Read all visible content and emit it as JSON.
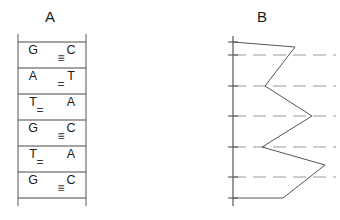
{
  "figure": {
    "panels": [
      {
        "id": "A",
        "label": "A",
        "label_x": 50,
        "label_y": 22
      },
      {
        "id": "B",
        "label": "B",
        "label_x": 262,
        "label_y": 22
      }
    ]
  },
  "panel_a": {
    "name": "dna-base-pair-ladder",
    "rail_left_x": 18,
    "rail_right_x": 86,
    "rung_top_y": 42,
    "rung_spacing": 26,
    "rung_count": 7,
    "rows": [
      {
        "left_base": "G",
        "right_base": "C",
        "bond": "≡",
        "bond_type": "triple",
        "bond_align": "right"
      },
      {
        "left_base": "A",
        "right_base": "T",
        "bond": "=",
        "bond_type": "double",
        "bond_align": "right"
      },
      {
        "left_base": "T",
        "right_base": "A",
        "bond": "=",
        "bond_type": "double",
        "bond_align": "left"
      },
      {
        "left_base": "G",
        "right_base": "C",
        "bond": "≡",
        "bond_type": "triple",
        "bond_align": "right"
      },
      {
        "left_base": "T",
        "right_base": "A",
        "bond": "=",
        "bond_type": "double",
        "bond_align": "left"
      },
      {
        "left_base": "G",
        "right_base": "C",
        "bond": "≡",
        "bond_type": "triple",
        "bond_align": "right"
      }
    ]
  },
  "chart_data": {
    "type": "line",
    "title": "B",
    "xlabel": "",
    "ylabel": "",
    "orientation": "vertical-axis-left",
    "grid": true,
    "grid_style": "dashed-horizontal",
    "legend": "none",
    "axis_x": 233,
    "axis_top_y": 42,
    "axis_bottom_y": 198,
    "gridline_y": [
      55,
      86,
      116,
      147,
      177
    ],
    "tick_y": [
      42,
      55,
      86,
      116,
      147,
      177,
      198
    ],
    "baseline_x": 233,
    "x": [
      295,
      265,
      312,
      262,
      325,
      283
    ],
    "y": [
      47,
      86,
      116,
      147,
      165,
      198
    ],
    "series": [
      {
        "name": "bond-strength-trace",
        "points": [
          {
            "x": 295,
            "y": 47,
            "amplitude": 62,
            "pairs_with": "G≡C"
          },
          {
            "x": 265,
            "y": 86,
            "amplitude": 32,
            "pairs_with": "A=T"
          },
          {
            "x": 312,
            "y": 116,
            "amplitude": 79,
            "pairs_with": "T=A"
          },
          {
            "x": 262,
            "y": 147,
            "amplitude": 29,
            "pairs_with": "G≡C"
          },
          {
            "x": 325,
            "y": 165,
            "amplitude": 92,
            "pairs_with": "T=A"
          },
          {
            "x": 283,
            "y": 198,
            "amplitude": 50,
            "pairs_with": "G≡C"
          }
        ]
      }
    ],
    "xlim": [
      233,
      340
    ],
    "ylim": [
      42,
      198
    ]
  }
}
